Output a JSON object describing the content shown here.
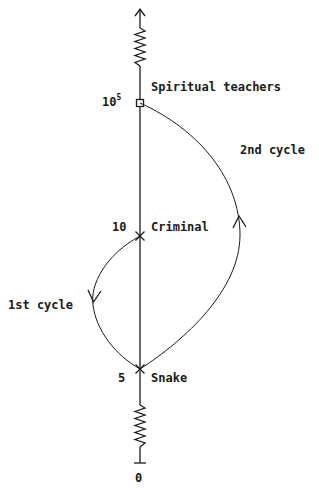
{
  "diagram": {
    "type": "cycle-ladder",
    "axis": {
      "ticks": [
        {
          "value": "0",
          "y": 463
        },
        {
          "value": "5",
          "y": 369
        },
        {
          "value": "10",
          "y": 236
        },
        {
          "base": "10",
          "exponent": "5",
          "y": 103
        }
      ]
    },
    "levels": [
      {
        "name": "Spiritual teachers",
        "tick": "10^5",
        "marker": "square"
      },
      {
        "name": "Criminal",
        "tick": "10",
        "marker": "x"
      },
      {
        "name": "Snake",
        "tick": "5",
        "marker": "x"
      }
    ],
    "cycles": [
      {
        "label": "1st cycle",
        "from": "Criminal",
        "to": "Snake",
        "side": "left",
        "direction": "down"
      },
      {
        "label": "2nd cycle",
        "from": "Snake",
        "to": "Spiritual teachers",
        "side": "right",
        "direction": "up"
      }
    ],
    "colors": {
      "line": "#1a1a1a",
      "background": "#ffffff"
    }
  }
}
